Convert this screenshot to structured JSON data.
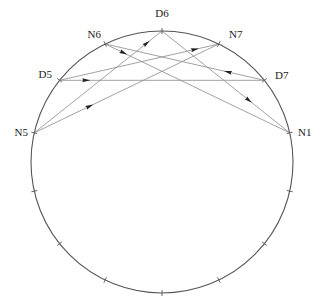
{
  "diagram": {
    "type": "circular-chord-diagram",
    "center": [
      162,
      162
    ],
    "radius": 131,
    "positions_count": 14,
    "colors": {
      "circle": "#555555",
      "chord": "#8a8a8a",
      "arrow": "#222222",
      "label": "#222222"
    },
    "nodes": [
      {
        "id": "D6",
        "label": "D6",
        "index": 0,
        "label_pos": [
          162,
          17
        ],
        "anchor": "middle"
      },
      {
        "id": "N7",
        "label": "N7",
        "index": 1,
        "label_pos": [
          229,
          38
        ],
        "anchor": "start"
      },
      {
        "id": "D7",
        "label": "D7",
        "index": 2,
        "label_pos": [
          275,
          79
        ],
        "anchor": "start"
      },
      {
        "id": "N1",
        "label": "N1",
        "index": 3,
        "label_pos": [
          298,
          136
        ],
        "anchor": "start"
      },
      {
        "id": "N5",
        "label": "N5",
        "index": 11,
        "label_pos": [
          28,
          136
        ],
        "anchor": "end"
      },
      {
        "id": "D5",
        "label": "D5",
        "index": 12,
        "label_pos": [
          52,
          78
        ],
        "anchor": "end"
      },
      {
        "id": "N6",
        "label": "N6",
        "index": 13,
        "label_pos": [
          101,
          38
        ],
        "anchor": "end"
      }
    ],
    "unlabeled_ticks": [
      4,
      5,
      6,
      7,
      8,
      9,
      10
    ],
    "edges": [
      {
        "from": "N5",
        "to": "D6",
        "arrow_t": 0.88
      },
      {
        "from": "N5",
        "to": "N7",
        "arrow_t": 0.3
      },
      {
        "from": "D5",
        "to": "D7",
        "arrow_t": 0.13
      },
      {
        "from": "D5",
        "to": "N7",
        "arrow_t": 0.85
      },
      {
        "from": "D7",
        "to": "N6",
        "arrow_t": 0.23
      },
      {
        "from": "N6",
        "to": "N1",
        "arrow_t": 0.1
      },
      {
        "from": "D6",
        "to": "N1",
        "arrow_t": 0.68
      }
    ]
  }
}
